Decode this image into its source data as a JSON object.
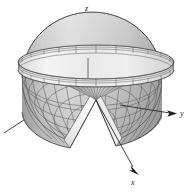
{
  "figure": {
    "background_color": "#ffffff",
    "width": 193,
    "height": 193,
    "line_color": "#4a4a4a",
    "axis_color": "#2b2b2b"
  },
  "axes": {
    "z": {
      "label": "z",
      "label_x": 88,
      "label_y": 11,
      "direction": "up",
      "arrow_tip_x": 88,
      "arrow_tip_y": 18,
      "origin_x": 88,
      "origin_y": 78
    },
    "y": {
      "label": "y",
      "label_x": 180,
      "label_y": 116,
      "direction": "right",
      "arrow_tip_x": 176,
      "arrow_tip_y": 113,
      "origin_x": 88,
      "origin_y": 78
    },
    "x": {
      "label": "x",
      "label_x": 134,
      "label_y": 182,
      "direction": "down-right",
      "arrow_tip_x": 138,
      "arrow_tip_y": 173,
      "origin_x": 88,
      "origin_y": 78
    },
    "negative_y": {
      "label": "",
      "end_x": 4,
      "end_y": 133
    }
  },
  "surfaces": {
    "funnel": {
      "name": "upper-funnel-surface",
      "description": "Inverted cone / funnel opening upward, wide outer rim narrowing to a dark throat at the center",
      "rim_center_x": 96,
      "rim_center_y": 62,
      "rim_radius_x": 78,
      "rim_radius_y": 17,
      "throat_center_x": 96,
      "throat_center_y": 72,
      "throat_radius_x": 17,
      "throat_radius_y": 5,
      "fill_light": "#f2f2f2",
      "fill_mid": "#cfcfcf",
      "fill_dark": "#7f7f7f",
      "throat_fill": "#2b2b2b",
      "meridians": 36,
      "parallels": 3
    },
    "dome": {
      "name": "lower-dome-surface",
      "description": "Hemispherical dome below the funnel with a wedge sector removed toward the viewer",
      "center_x": 92,
      "center_y": 78,
      "radius_x": 70,
      "radius_y": 66,
      "fill_light": "#dedede",
      "fill_mid": "#bdbdbd",
      "fill_dark": "#9a9a9a",
      "meridians": 24,
      "parallels": 6,
      "wedge_opening_degrees": 55
    },
    "interior": {
      "name": "cut-interior-surface",
      "description": "Interior cone wall exposed by the wedge cut, shaded with radial hatching",
      "fill": "#b5b5b5",
      "highlight_fill": "#f6f6f6"
    }
  }
}
